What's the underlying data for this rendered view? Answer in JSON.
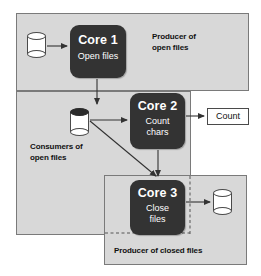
{
  "diagram": {
    "regions": [
      {
        "id": "producer-open",
        "label": "Producer of\nopen files"
      },
      {
        "id": "consumers-open",
        "label": "Consumers of\nopen files"
      },
      {
        "id": "producer-closed",
        "label": "Producer of closed files"
      }
    ],
    "cores": [
      {
        "id": "core-1",
        "title": "Core 1",
        "subtitle": "Open files"
      },
      {
        "id": "core-2",
        "title": "Core 2",
        "subtitle": "Count\nchars"
      },
      {
        "id": "core-3",
        "title": "Core 3",
        "subtitle": "Close\nfiles"
      }
    ],
    "nodes": [
      {
        "id": "cyl-input",
        "icon": "cylinder-icon",
        "style": "open-top",
        "label": ""
      },
      {
        "id": "cyl-queue",
        "icon": "cylinder-icon",
        "style": "filled-top",
        "label": ""
      },
      {
        "id": "cyl-output",
        "icon": "cylinder-icon",
        "style": "open-top",
        "label": ""
      }
    ],
    "count_box": {
      "label": "Count"
    },
    "edges": [
      {
        "from": "cyl-input",
        "to": "core-1",
        "kind": "arrow"
      },
      {
        "from": "core-1",
        "to": "cyl-queue",
        "kind": "arrow"
      },
      {
        "from": "cyl-queue",
        "to": "core-2",
        "kind": "arrow"
      },
      {
        "from": "cyl-queue",
        "to": "core-3",
        "kind": "arrow"
      },
      {
        "from": "core-2",
        "to": "count-box",
        "kind": "arrow"
      },
      {
        "from": "core-2",
        "to": "core-3",
        "kind": "arrow"
      },
      {
        "from": "core-3",
        "to": "cyl-output",
        "kind": "arrow"
      }
    ],
    "colors": {
      "region_fill": "#d8d8d8",
      "region_border": "#7a7a7a",
      "core_fill": "#333333",
      "core_text": "#ffffff",
      "node_fill": "#ffffff",
      "node_stroke": "#4a4a4a",
      "arrow": "#333333",
      "page_background": "#ffffff"
    }
  }
}
